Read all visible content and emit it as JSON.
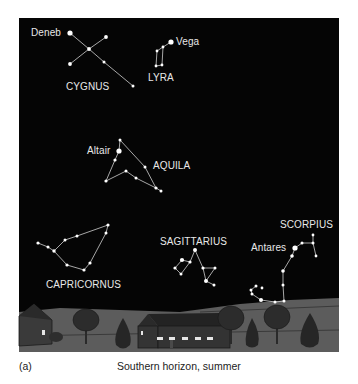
{
  "figure": {
    "panel_label": "(a)",
    "caption": "Southern horizon, summer",
    "sky_color": "#050505",
    "ground_color": "#5a5a5a",
    "star_color": "#ffffff",
    "line_color": "#cfcfcf"
  },
  "constellations": [
    {
      "name": "CYGNUS",
      "bright_star": "Deneb"
    },
    {
      "name": "LYRA",
      "bright_star": "Vega"
    },
    {
      "name": "AQUILA",
      "bright_star": "Altair"
    },
    {
      "name": "CAPRICORNUS"
    },
    {
      "name": "SAGITTARIUS"
    },
    {
      "name": "SCORPIUS",
      "bright_star": "Antares"
    }
  ]
}
